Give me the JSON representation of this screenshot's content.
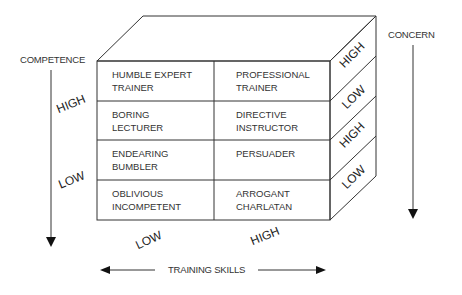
{
  "diagram": {
    "axes": {
      "competence": {
        "label": "COMPETENCE",
        "high": "HIGH",
        "low": "LOW"
      },
      "concern": {
        "label": "CONCERN",
        "levels": [
          "HIGH",
          "LOW",
          "HIGH",
          "LOW"
        ]
      },
      "training_skills": {
        "label": "TRAINING SKILLS",
        "low": "LOW",
        "high": "HIGH"
      }
    },
    "cells": [
      {
        "line1": "HUMBLE EXPERT",
        "line2": "TRAINER"
      },
      {
        "line1": "PROFESSIONAL",
        "line2": "TRAINER"
      },
      {
        "line1": "BORING",
        "line2": "LECTURER"
      },
      {
        "line1": "DIRECTIVE",
        "line2": "INSTRUCTOR"
      },
      {
        "line1": "ENDEARING",
        "line2": "BUMBLER"
      },
      {
        "line1": "PERSUADER",
        "line2": ""
      },
      {
        "line1": "OBLIVIOUS",
        "line2": "INCOMPETENT"
      },
      {
        "line1": "ARROGANT",
        "line2": "CHARLATAN"
      }
    ],
    "colors": {
      "line": "#333333",
      "background": "#ffffff"
    }
  }
}
